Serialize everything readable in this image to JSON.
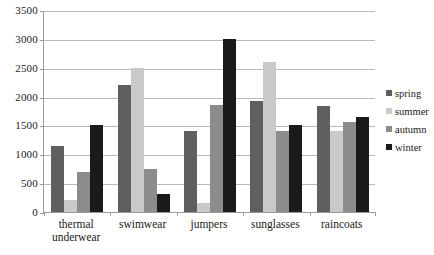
{
  "chart_data": {
    "type": "bar",
    "title": "",
    "subtitle": "",
    "xlabel": "",
    "ylabel": "",
    "categories": [
      "thermal\nunderwear",
      "swimwear",
      "jumpers",
      "sunglasses",
      "raincoats"
    ],
    "series": [
      {
        "name": "spring",
        "color": "#5f5f5f",
        "values": [
          1150,
          2200,
          1400,
          1930,
          1840
        ]
      },
      {
        "name": "summer",
        "color": "#c9c9c9",
        "values": [
          200,
          2500,
          150,
          2600,
          1400
        ]
      },
      {
        "name": "autumn",
        "color": "#8c8c8c",
        "values": [
          700,
          750,
          1850,
          1400,
          1560
        ]
      },
      {
        "name": "winter",
        "color": "#1a1a1a",
        "values": [
          1500,
          320,
          3000,
          1500,
          1650
        ]
      }
    ],
    "ylim": [
      0,
      3500
    ],
    "ytick_step": 500,
    "yticks": [
      "0",
      "500",
      "1000",
      "1500",
      "2000",
      "2500",
      "3000",
      "3500"
    ],
    "grid": true,
    "legend_position": "right",
    "axis_color": "#9a9a9a",
    "grid_color": "#b8b8b8",
    "background": "#ffffff"
  }
}
